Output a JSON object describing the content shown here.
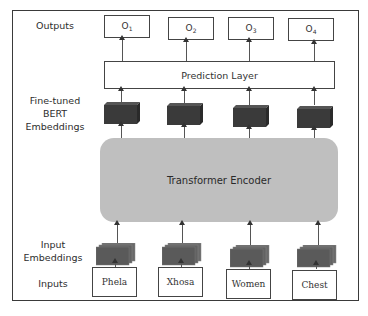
{
  "diagram": {
    "row_labels": {
      "outputs": "Outputs",
      "bert_line1": "Fine-tuned",
      "bert_line2": "BERT",
      "bert_line3": "Embeddings",
      "input_emb_line1": "Input",
      "input_emb_line2": "Embeddings",
      "inputs": "Inputs"
    },
    "outputs": [
      {
        "base": "O",
        "sub": "1"
      },
      {
        "base": "O",
        "sub": "2"
      },
      {
        "base": "O",
        "sub": "3"
      },
      {
        "base": "O",
        "sub": "4"
      }
    ],
    "prediction_layer": "Prediction Layer",
    "encoder": "Transformer Encoder",
    "inputs": [
      "Phela",
      "Xhosa",
      "Women",
      "Chest"
    ],
    "colors": {
      "encoder_fill": "#bfbfbf",
      "bert_cube": "#3a3a3a",
      "input_cube": "#5a5a5a",
      "border": "#3a3a3a"
    }
  }
}
